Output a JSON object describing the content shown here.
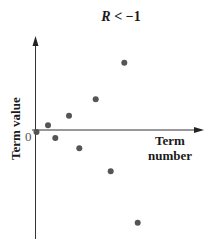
{
  "title": {
    "variable": "R",
    "relation": " < −1"
  },
  "axes": {
    "xlabel_line1": "Term",
    "xlabel_line2": "number",
    "ylabel": "Term value",
    "origin_label": "0"
  },
  "colors": {
    "point": "#555555",
    "axis": "#333333",
    "text": "#1a1a1a"
  },
  "chart_data": {
    "type": "scatter",
    "xlabel": "Term number",
    "ylabel": "Term value",
    "grid": false,
    "legend": null,
    "x": [
      0,
      1,
      2,
      3,
      4,
      5,
      6,
      7,
      8
    ],
    "values": [
      0,
      4.7,
      -8,
      14.3,
      -18.3,
      30.7,
      -41.3,
      67.3,
      -92.7
    ],
    "pixel_positions": [
      [
        36.5,
        132
      ],
      [
        48,
        125.3
      ],
      [
        55.3,
        138
      ],
      [
        69,
        115.7
      ],
      [
        79.3,
        148.3
      ],
      [
        95.7,
        99.3
      ],
      [
        110.7,
        171.3
      ],
      [
        124.3,
        62.7
      ],
      [
        137.7,
        222.7
      ]
    ],
    "annotations": [
      "0 at origin"
    ],
    "note": "Alternating-sign terms with growing magnitude (geometric sequence with ratio below -1); y values in pixel units relative to x-axis"
  }
}
